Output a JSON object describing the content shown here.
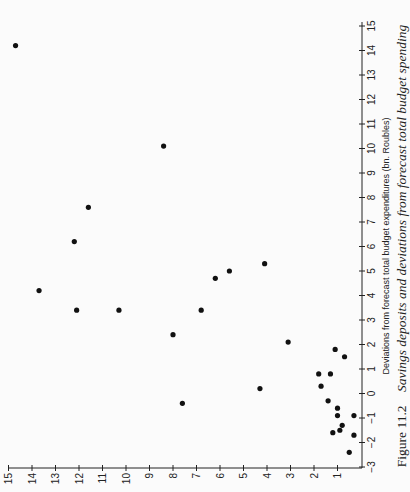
{
  "chart_data": {
    "type": "scatter",
    "orientation_note": "figure printed rotated 90 degrees counter-clockwise",
    "title": "",
    "caption": {
      "label": "Figure 11.2",
      "text": "Savings deposits and deviations from forecast total budget spending"
    },
    "xlabel": "Deviations from forecast total budget expenditures (bn. Roubles)",
    "ylabel": "",
    "xlim": [
      -3,
      15
    ],
    "ylim": [
      0,
      15
    ],
    "xticks": [
      -3,
      -2,
      -1,
      0,
      1,
      2,
      3,
      4,
      5,
      6,
      7,
      8,
      9,
      10,
      11,
      12,
      13,
      14,
      15
    ],
    "yticks": [
      1,
      2,
      3,
      4,
      5,
      6,
      7,
      8,
      9,
      10,
      11,
      12,
      13,
      14,
      15
    ],
    "grid": false,
    "legend": null,
    "points": [
      {
        "x": 14.2,
        "y": 14.7
      },
      {
        "x": 10.1,
        "y": 8.4
      },
      {
        "x": 7.6,
        "y": 11.6
      },
      {
        "x": 6.2,
        "y": 12.2
      },
      {
        "x": 5.3,
        "y": 4.1
      },
      {
        "x": 5.0,
        "y": 5.6
      },
      {
        "x": 4.7,
        "y": 6.2
      },
      {
        "x": 4.2,
        "y": 13.7
      },
      {
        "x": 3.4,
        "y": 12.1
      },
      {
        "x": 3.4,
        "y": 10.3
      },
      {
        "x": 3.4,
        "y": 6.8
      },
      {
        "x": 2.4,
        "y": 8.0
      },
      {
        "x": 2.1,
        "y": 3.1
      },
      {
        "x": 1.8,
        "y": 1.1
      },
      {
        "x": 1.5,
        "y": 0.7
      },
      {
        "x": 0.8,
        "y": 1.8
      },
      {
        "x": 0.8,
        "y": 1.3
      },
      {
        "x": 0.3,
        "y": 1.7
      },
      {
        "x": 0.2,
        "y": 4.3
      },
      {
        "x": -0.3,
        "y": 1.4
      },
      {
        "x": -0.4,
        "y": 7.6
      },
      {
        "x": -0.6,
        "y": 1.0
      },
      {
        "x": -0.9,
        "y": 1.0
      },
      {
        "x": -0.9,
        "y": 0.3
      },
      {
        "x": -1.3,
        "y": 0.8
      },
      {
        "x": -1.5,
        "y": 0.9
      },
      {
        "x": -1.6,
        "y": 1.2
      },
      {
        "x": -1.7,
        "y": 0.3
      },
      {
        "x": -2.4,
        "y": 0.5
      }
    ]
  },
  "colors": {
    "background": "#fbfbfb",
    "ink": "#111111"
  }
}
